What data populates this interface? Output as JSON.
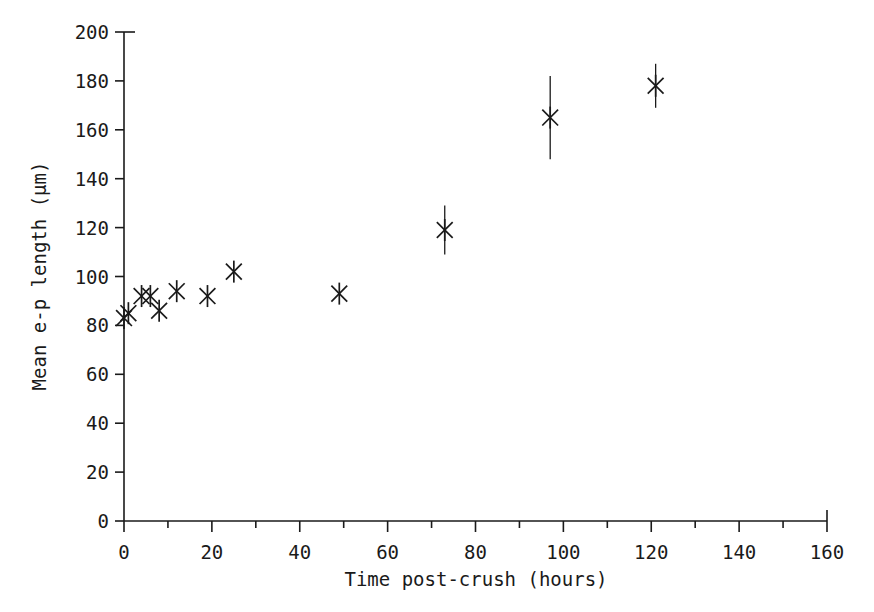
{
  "chart_data": {
    "type": "scatter",
    "title": "",
    "xlabel": "Time post-crush  (hours)",
    "ylabel": "Mean e-p length  (µm)",
    "xlim": [
      0,
      160
    ],
    "ylim": [
      0,
      200
    ],
    "x_major_ticks": [
      0,
      20,
      40,
      60,
      80,
      100,
      120,
      140,
      160
    ],
    "x_minor_ticks": [
      10,
      30,
      50,
      70,
      90,
      110,
      130,
      150
    ],
    "y_major_ticks": [
      0,
      20,
      40,
      60,
      80,
      100,
      120,
      140,
      160,
      180,
      200
    ],
    "x_tick_labels": [
      "0",
      "20",
      "40",
      "60",
      "80",
      "100",
      "120",
      "140",
      "160"
    ],
    "y_tick_labels": [
      "0",
      "20",
      "40",
      "60",
      "80",
      "100",
      "120",
      "140",
      "160",
      "180",
      "200"
    ],
    "grid": false,
    "legend": false,
    "marker_style": "asterisk",
    "line_color": "#1a1a1a",
    "background": "#ffffff",
    "points": [
      {
        "x": 0,
        "y": 83,
        "err": 0
      },
      {
        "x": 1,
        "y": 85,
        "err": 0
      },
      {
        "x": 4,
        "y": 92,
        "err": 0
      },
      {
        "x": 6,
        "y": 92,
        "err": 0
      },
      {
        "x": 8,
        "y": 86,
        "err": 0
      },
      {
        "x": 12,
        "y": 94,
        "err": 0
      },
      {
        "x": 19,
        "y": 92,
        "err": 0
      },
      {
        "x": 25,
        "y": 102,
        "err": 0
      },
      {
        "x": 49,
        "y": 93,
        "err": 0
      },
      {
        "x": 73,
        "y": 119,
        "err": 10
      },
      {
        "x": 97,
        "y": 165,
        "err": 17
      },
      {
        "x": 121,
        "y": 178,
        "err": 9
      }
    ]
  },
  "figure": {
    "alt": "Scatter plot of mean e-p length versus time post-crush"
  }
}
